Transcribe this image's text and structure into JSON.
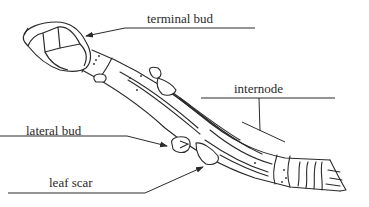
{
  "diagram": {
    "labels": {
      "terminal_bud": "terminal bud",
      "internode": "internode",
      "lateral_bud": "lateral bud",
      "leaf_scar": "leaf scar"
    },
    "colors": {
      "stroke": "#2a2a2a",
      "background": "#ffffff"
    }
  }
}
